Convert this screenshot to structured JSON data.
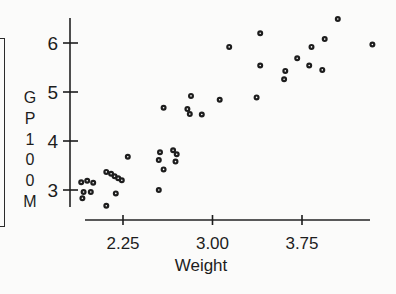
{
  "colors": {
    "ink": "#1d1d1d",
    "background": "#fbfbfa",
    "marker_center": "#ffffff"
  },
  "chart_data": {
    "type": "scatter",
    "title": "",
    "xlabel": "Weight",
    "ylabel": "GP100M",
    "legend": null,
    "grid": false,
    "marker": "black-dot-with-white-center",
    "x_ticks": [
      2.25,
      3.0,
      3.75
    ],
    "x_tick_labels": [
      "2.25",
      "3.00",
      "3.75"
    ],
    "y_ticks": [
      3,
      4,
      5,
      6
    ],
    "y_tick_labels": [
      "3",
      "4",
      "5",
      "6"
    ],
    "xlim": [
      1.93,
      4.32
    ],
    "ylim": [
      2.65,
      6.51
    ],
    "points": [
      [
        1.9,
        3.16
      ],
      [
        1.95,
        3.19
      ],
      [
        2.0,
        3.15
      ],
      [
        1.92,
        2.96
      ],
      [
        1.98,
        2.96
      ],
      [
        1.91,
        2.83
      ],
      [
        2.11,
        2.68
      ],
      [
        2.19,
        2.93
      ],
      [
        2.55,
        3.0
      ],
      [
        2.11,
        3.37
      ],
      [
        2.15,
        3.33
      ],
      [
        2.18,
        3.28
      ],
      [
        2.21,
        3.24
      ],
      [
        2.24,
        3.2
      ],
      [
        2.29,
        3.68
      ],
      [
        2.56,
        3.77
      ],
      [
        2.67,
        3.81
      ],
      [
        2.7,
        3.73
      ],
      [
        2.55,
        3.61
      ],
      [
        2.69,
        3.58
      ],
      [
        2.59,
        3.42
      ],
      [
        2.59,
        4.68
      ],
      [
        2.79,
        4.65
      ],
      [
        2.81,
        4.55
      ],
      [
        2.91,
        4.54
      ],
      [
        2.82,
        4.92
      ],
      [
        3.06,
        4.84
      ],
      [
        3.37,
        4.89
      ],
      [
        3.14,
        5.92
      ],
      [
        3.4,
        6.2
      ],
      [
        3.4,
        5.54
      ],
      [
        3.6,
        5.26
      ],
      [
        3.61,
        5.43
      ],
      [
        3.71,
        5.69
      ],
      [
        3.81,
        5.54
      ],
      [
        3.83,
        5.92
      ],
      [
        3.92,
        5.45
      ],
      [
        3.94,
        6.08
      ],
      [
        4.05,
        6.49
      ],
      [
        4.34,
        5.97
      ]
    ]
  }
}
